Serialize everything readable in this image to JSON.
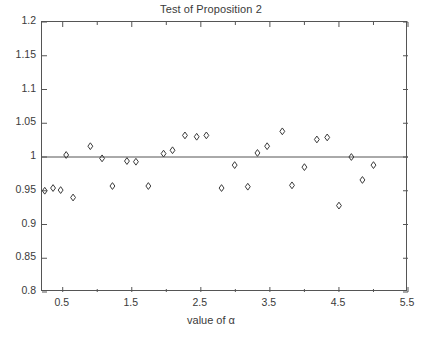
{
  "chart_data": {
    "type": "scatter",
    "title": "Test of Proposition 2",
    "xlabel": "value of α",
    "ylabel": "",
    "xlim": [
      0.2,
      5.5
    ],
    "ylim": [
      0.8,
      1.2
    ],
    "grid": false,
    "legend": null,
    "marker": "diamond-open",
    "marker_color": "#3a3a3a",
    "reference_line": {
      "axis": "y",
      "value": 1,
      "color": "#555555"
    },
    "xticks": [
      0.5,
      1.5,
      2.5,
      3.5,
      4.5,
      5.5
    ],
    "xtick_labels": [
      "0.5",
      "1.5",
      "2.5",
      "3.5",
      "4.5",
      "5.5"
    ],
    "xminor_ticks": [
      1.0,
      2.0,
      3.0,
      4.0,
      5.0
    ],
    "yticks": [
      0.8,
      0.85,
      0.9,
      0.95,
      1.0,
      1.05,
      1.1,
      1.15,
      1.2
    ],
    "ytick_labels": [
      "0.8",
      "0.85",
      "0.9",
      "0.95",
      "1",
      "1.05",
      "1.1",
      "1.15",
      "1.2"
    ],
    "points": [
      {
        "x": 0.24,
        "y": 0.95
      },
      {
        "x": 0.36,
        "y": 0.954
      },
      {
        "x": 0.47,
        "y": 0.951
      },
      {
        "x": 0.55,
        "y": 1.003
      },
      {
        "x": 0.65,
        "y": 0.94
      },
      {
        "x": 0.9,
        "y": 1.016
      },
      {
        "x": 1.07,
        "y": 0.998
      },
      {
        "x": 1.22,
        "y": 0.957
      },
      {
        "x": 1.43,
        "y": 0.994
      },
      {
        "x": 1.56,
        "y": 0.993
      },
      {
        "x": 1.74,
        "y": 0.957
      },
      {
        "x": 1.96,
        "y": 1.005
      },
      {
        "x": 2.09,
        "y": 1.01
      },
      {
        "x": 2.27,
        "y": 1.032
      },
      {
        "x": 2.44,
        "y": 1.03
      },
      {
        "x": 2.58,
        "y": 1.032
      },
      {
        "x": 2.8,
        "y": 0.954
      },
      {
        "x": 2.99,
        "y": 0.988
      },
      {
        "x": 3.18,
        "y": 0.956
      },
      {
        "x": 3.32,
        "y": 1.006
      },
      {
        "x": 3.46,
        "y": 1.016
      },
      {
        "x": 3.68,
        "y": 1.038
      },
      {
        "x": 3.82,
        "y": 0.958
      },
      {
        "x": 4.0,
        "y": 0.985
      },
      {
        "x": 4.18,
        "y": 1.026
      },
      {
        "x": 4.33,
        "y": 1.029
      },
      {
        "x": 4.5,
        "y": 0.928
      },
      {
        "x": 4.68,
        "y": 1.0
      },
      {
        "x": 4.84,
        "y": 0.966
      },
      {
        "x": 5.0,
        "y": 0.988
      }
    ]
  }
}
